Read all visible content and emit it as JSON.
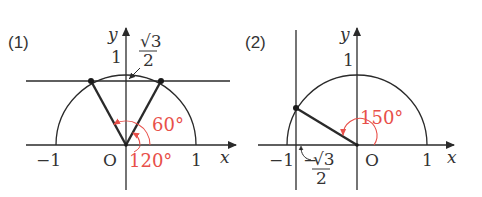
{
  "colors": {
    "line": "#2a2a2a",
    "accent": "#e8504a",
    "text": "#333333"
  },
  "panels": [
    {
      "label": "(1)",
      "axis_x_label": "x",
      "axis_y_label": "y",
      "origin_label": "O",
      "tick_neg_one": "−1",
      "tick_one_x": "1",
      "tick_one_y": "1",
      "annotation_sqrt": "√3",
      "annotation_den": "2",
      "line_desc": "y = √3/2",
      "angles": [
        {
          "label": "60°",
          "degrees": 60
        },
        {
          "label": "120°",
          "degrees": 120
        }
      ]
    },
    {
      "label": "(2)",
      "axis_x_label": "x",
      "axis_y_label": "y",
      "origin_label": "O",
      "tick_neg_one": "−1",
      "tick_one_x": "1",
      "tick_one_y": "1",
      "annotation_sign": "−",
      "annotation_sqrt": "√3",
      "annotation_den": "2",
      "line_desc": "x = −√3/2",
      "angles": [
        {
          "label": "150°",
          "degrees": 150
        }
      ]
    }
  ]
}
